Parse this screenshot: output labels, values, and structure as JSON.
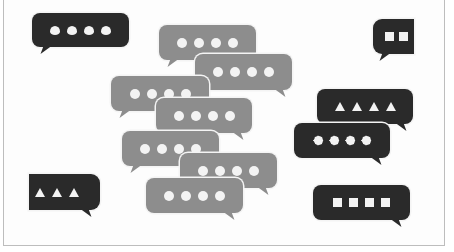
{
  "scene": {
    "description": "Illustration of many chat speech bubbles with typing indicator symbols",
    "colors": {
      "grey_bubble": "#8d8d8d",
      "dark_bubble": "#2a2a2a",
      "symbol": "#f3f3f3",
      "frame_border": "#bdbdbd"
    }
  },
  "bubbles": [
    {
      "id": "dark-topleft",
      "tone": "dark",
      "x": 32,
      "y": 13,
      "w": 97,
      "h": 34,
      "tail": "left",
      "tail_x": 10,
      "symbol": "leaf",
      "count": 4
    },
    {
      "id": "dark-topright",
      "tone": "dark",
      "x": 373,
      "y": 19,
      "w": 41,
      "h": 35,
      "tail": "left",
      "tail_x": 8,
      "symbol": "square",
      "count": 2
    },
    {
      "id": "grey-a",
      "tone": "grey",
      "x": 159,
      "y": 25,
      "w": 97,
      "h": 35,
      "tail": "left",
      "tail_x": 10,
      "symbol": "dot",
      "count": 4
    },
    {
      "id": "grey-b",
      "tone": "grey",
      "x": 195,
      "y": 54,
      "w": 97,
      "h": 36,
      "tail": "right",
      "tail_x": 8,
      "symbol": "dot",
      "count": 4
    },
    {
      "id": "grey-c",
      "tone": "grey",
      "x": 111,
      "y": 76,
      "w": 98,
      "h": 35,
      "tail": "left",
      "tail_x": 10,
      "symbol": "dot",
      "count": 4
    },
    {
      "id": "grey-d",
      "tone": "grey",
      "x": 156,
      "y": 98,
      "w": 96,
      "h": 35,
      "tail": "right",
      "tail_x": 10,
      "symbol": "dot",
      "count": 4
    },
    {
      "id": "dark-triangles4",
      "tone": "dark",
      "x": 317,
      "y": 89,
      "w": 96,
      "h": 35,
      "tail": "right",
      "tail_x": 8,
      "symbol": "tri",
      "count": 4
    },
    {
      "id": "dark-gears",
      "tone": "dark",
      "x": 294,
      "y": 123,
      "w": 96,
      "h": 35,
      "tail": "right",
      "tail_x": 10,
      "symbol": "gear",
      "count": 4
    },
    {
      "id": "grey-e",
      "tone": "grey",
      "x": 122,
      "y": 131,
      "w": 97,
      "h": 35,
      "tail": "left",
      "tail_x": 10,
      "symbol": "dot",
      "count": 4
    },
    {
      "id": "grey-f",
      "tone": "grey",
      "x": 180,
      "y": 153,
      "w": 97,
      "h": 35,
      "tail": "right",
      "tail_x": 10,
      "symbol": "dot",
      "count": 4
    },
    {
      "id": "dark-triangles3",
      "tone": "dark",
      "x": 29,
      "y": 174,
      "w": 71,
      "h": 36,
      "tail": "right",
      "tail_x": 10,
      "symbol": "tri",
      "count": 3
    },
    {
      "id": "grey-g",
      "tone": "grey",
      "x": 146,
      "y": 178,
      "w": 97,
      "h": 35,
      "tail": "right",
      "tail_x": 10,
      "symbol": "dot",
      "count": 4
    },
    {
      "id": "dark-squares4",
      "tone": "dark",
      "x": 313,
      "y": 185,
      "w": 97,
      "h": 35,
      "tail": "right",
      "tail_x": 10,
      "symbol": "square",
      "count": 4
    }
  ]
}
